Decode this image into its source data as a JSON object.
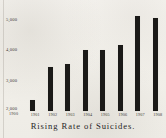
{
  "chart_data": {
    "type": "bar",
    "title": "Rising Rate of Suicides.",
    "xlabel": "",
    "ylabel": "",
    "categories": [
      "1901",
      "1902",
      "1903",
      "1904",
      "1905",
      "1906",
      "1907",
      "1908"
    ],
    "values": [
      2350,
      3450,
      3550,
      4000,
      4000,
      4150,
      5100,
      5050
    ],
    "ylim": [
      2000,
      5300
    ],
    "ytick_labels": [
      "5,000",
      "4,000",
      "3,000",
      "2,000"
    ],
    "ytick_values": [
      5000,
      4000,
      3000,
      2000
    ],
    "baseline_label": "2,000",
    "baseline_sublabel": "1900",
    "grid": false,
    "legend": false,
    "bar_color": "#1b1a18",
    "background_color": "#f1efe9"
  },
  "caption": {
    "text": "Rising Rate of Suicides."
  }
}
